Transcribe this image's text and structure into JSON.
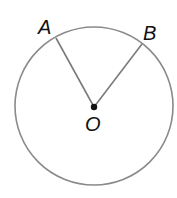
{
  "diagram": {
    "type": "circle-with-central-angle",
    "circle": {
      "cx": 94,
      "cy": 106,
      "r": 79,
      "stroke": "#8a8a8a"
    },
    "center": {
      "label": "O",
      "x": 94,
      "y": 107
    },
    "points": [
      {
        "label": "A",
        "x": 56,
        "y": 38
      },
      {
        "label": "B",
        "x": 142,
        "y": 44
      }
    ],
    "segments": [
      {
        "from": "O",
        "to": "A"
      },
      {
        "from": "O",
        "to": "B"
      }
    ],
    "line_color": "#7a7a7a",
    "label_color": "#111111"
  }
}
